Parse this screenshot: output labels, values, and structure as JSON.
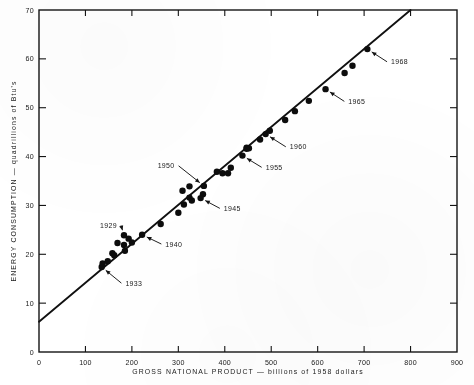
{
  "chart_data": {
    "type": "scatter",
    "title": "",
    "xlabel": "GROSS NATIONAL PRODUCT — billions of 1958 dollars",
    "ylabel": "ENERGY CONSUMPTION — quadrillions of Btu's",
    "xlim": [
      0,
      900
    ],
    "ylim": [
      0,
      70
    ],
    "xticks": [
      0,
      100,
      200,
      300,
      400,
      500,
      600,
      700,
      800,
      900
    ],
    "yticks": [
      0,
      10,
      20,
      30,
      40,
      50,
      60,
      70
    ],
    "xticklabels": [
      "0",
      "100",
      "200",
      "300",
      "400",
      "500",
      "600",
      "700",
      "800",
      "900"
    ],
    "yticklabels": [
      "0",
      "10",
      "20",
      "30",
      "40",
      "50",
      "60",
      "70"
    ],
    "grid": false,
    "legend": null,
    "series": [
      {
        "name": "Energy consumption vs GNP, 1929-1968",
        "marker": "filled-circle",
        "color": "#0d0d0d",
        "points": [
          {
            "label": "1929",
            "x": 183,
            "y": 23.9
          },
          {
            "label": "1930",
            "x": 169,
            "y": 22.3
          },
          {
            "label": "1931",
            "x": 158,
            "y": 20.2
          },
          {
            "label": "1932",
            "x": 137,
            "y": 18.1
          },
          {
            "label": "1933",
            "x": 135,
            "y": 17.4
          },
          {
            "label": "1934",
            "x": 148,
            "y": 18.6
          },
          {
            "label": "1935",
            "x": 162,
            "y": 19.8
          },
          {
            "label": "1936",
            "x": 183,
            "y": 21.9
          },
          {
            "label": "1937",
            "x": 193,
            "y": 23.2
          },
          {
            "label": "1938",
            "x": 185,
            "y": 20.7
          },
          {
            "label": "1939",
            "x": 200,
            "y": 22.4
          },
          {
            "label": "1940",
            "x": 222,
            "y": 24.0
          },
          {
            "label": "1941",
            "x": 262,
            "y": 26.2
          },
          {
            "label": "1942",
            "x": 300,
            "y": 28.5
          },
          {
            "label": "1943",
            "x": 329,
            "y": 31.0
          },
          {
            "label": "1944",
            "x": 353,
            "y": 32.3
          },
          {
            "label": "1945",
            "x": 348,
            "y": 31.5
          },
          {
            "label": "1946",
            "x": 312,
            "y": 30.2
          },
          {
            "label": "1947",
            "x": 309,
            "y": 33.0
          },
          {
            "label": "1948",
            "x": 324,
            "y": 33.9
          },
          {
            "label": "1949",
            "x": 324,
            "y": 31.6
          },
          {
            "label": "1950",
            "x": 355,
            "y": 34.0
          },
          {
            "label": "1951",
            "x": 383,
            "y": 36.9
          },
          {
            "label": "1952",
            "x": 395,
            "y": 36.6
          },
          {
            "label": "1953",
            "x": 413,
            "y": 37.7
          },
          {
            "label": "1954",
            "x": 407,
            "y": 36.6
          },
          {
            "label": "1955",
            "x": 438,
            "y": 40.2
          },
          {
            "label": "1956",
            "x": 447,
            "y": 41.8
          },
          {
            "label": "1957",
            "x": 452,
            "y": 41.7
          },
          {
            "label": "1958",
            "x": 447,
            "y": 41.6
          },
          {
            "label": "1959",
            "x": 476,
            "y": 43.5
          },
          {
            "label": "1960",
            "x": 488,
            "y": 44.6
          },
          {
            "label": "1961",
            "x": 497,
            "y": 45.3
          },
          {
            "label": "1962",
            "x": 530,
            "y": 47.5
          },
          {
            "label": "1963",
            "x": 551,
            "y": 49.3
          },
          {
            "label": "1964",
            "x": 581,
            "y": 51.4
          },
          {
            "label": "1965",
            "x": 617,
            "y": 53.8
          },
          {
            "label": "1966",
            "x": 658,
            "y": 57.1
          },
          {
            "label": "1967",
            "x": 675,
            "y": 58.6
          },
          {
            "label": "1968",
            "x": 707,
            "y": 62.0
          }
        ]
      }
    ],
    "fit_line": {
      "name": "fitted regression line",
      "x_start": 0,
      "y_start": 6.2,
      "x_end": 800,
      "y_end": 70.0,
      "slope": 0.0798,
      "intercept": 6.2
    },
    "annotations": [
      {
        "label": "1929",
        "text_x": 168,
        "text_y": 25.9,
        "point_x": 183,
        "point_y": 23.9
      },
      {
        "label": "1933",
        "text_x": 186,
        "text_y": 14.1,
        "point_x": 135,
        "point_y": 17.4
      },
      {
        "label": "1940",
        "text_x": 272,
        "text_y": 22.1,
        "point_x": 222,
        "point_y": 24.0
      },
      {
        "label": "1945",
        "text_x": 398,
        "text_y": 29.4,
        "point_x": 348,
        "point_y": 31.5
      },
      {
        "label": "1950",
        "text_x": 292,
        "text_y": 38.1,
        "point_x": 355,
        "point_y": 34.0
      },
      {
        "label": "1955",
        "text_x": 488,
        "text_y": 37.8,
        "point_x": 438,
        "point_y": 40.2
      },
      {
        "label": "1960",
        "text_x": 540,
        "text_y": 42.0,
        "point_x": 488,
        "point_y": 44.6
      },
      {
        "label": "1965",
        "text_x": 666,
        "text_y": 51.3,
        "point_x": 617,
        "point_y": 53.8
      },
      {
        "label": "1968",
        "text_x": 758,
        "text_y": 59.4,
        "point_x": 707,
        "point_y": 62.0
      }
    ]
  }
}
